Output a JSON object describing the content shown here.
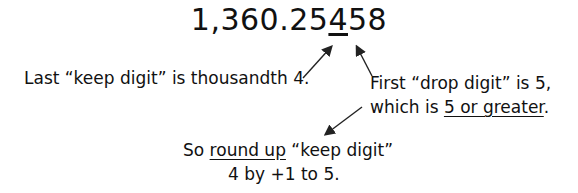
{
  "number": {
    "prefix": "1,360.25",
    "keep_digit": "4",
    "suffix": "58"
  },
  "left_note": "Last “keep digit” is thousandth 4.",
  "right_note": {
    "line1": "First “drop digit” is 5,",
    "line2_prefix": "which is ",
    "line2_underlined": "5 or greater",
    "line2_suffix": "."
  },
  "bottom_note": {
    "line1_prefix": "So ",
    "line1_underlined": "round up",
    "line1_suffix": " “keep digit”",
    "line2": "4 by +1 to 5."
  }
}
